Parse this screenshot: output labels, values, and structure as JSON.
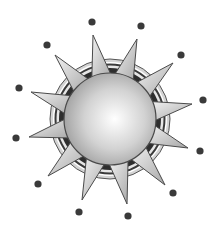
{
  "illustration": {
    "subject": "sun-clipart",
    "center": [
      110,
      119
    ],
    "sphere_radius": 46,
    "rings": [
      {
        "r": 60,
        "fill": "#d4d4d4",
        "stroke": "#555555"
      },
      {
        "r": 57,
        "fill": "#ffffff",
        "stroke": "none"
      },
      {
        "r": 55.5,
        "fill": "#3a3a3a",
        "stroke": "none"
      },
      {
        "r": 53.5,
        "fill": "#e6e6e6",
        "stroke": "none"
      },
      {
        "r": 51,
        "fill": "#2e2e2e",
        "stroke": "none"
      }
    ],
    "spikes": [
      {
        "tip": [
          93,
          35
        ],
        "base_angle_deg": -104
      },
      {
        "tip": [
          137,
          39
        ],
        "base_angle_deg": -72
      },
      {
        "tip": [
          173,
          63
        ],
        "base_angle_deg": -42
      },
      {
        "tip": [
          192,
          104
        ],
        "base_angle_deg": -11
      },
      {
        "tip": [
          188,
          148
        ],
        "base_angle_deg": 20
      },
      {
        "tip": [
          165,
          185
        ],
        "base_angle_deg": 50
      },
      {
        "tip": [
          127,
          204
        ],
        "base_angle_deg": 79
      },
      {
        "tip": [
          82,
          200
        ],
        "base_angle_deg": 109
      },
      {
        "tip": [
          48,
          176
        ],
        "base_angle_deg": 138
      },
      {
        "tip": [
          29,
          137
        ],
        "base_angle_deg": 168
      },
      {
        "tip": [
          31,
          92
        ],
        "base_angle_deg": 199
      },
      {
        "tip": [
          55,
          55
        ],
        "base_angle_deg": 229
      }
    ],
    "spike_half_width_deg": 13,
    "spike_base_radius": 44,
    "dots": [
      [
        92,
        22
      ],
      [
        141,
        26
      ],
      [
        181,
        55
      ],
      [
        203,
        100
      ],
      [
        200,
        151
      ],
      [
        173,
        193
      ],
      [
        128,
        216
      ],
      [
        79,
        212
      ],
      [
        38,
        184
      ],
      [
        16,
        138
      ],
      [
        19,
        88
      ],
      [
        47,
        45
      ]
    ],
    "dot_radius": 3.6,
    "colors": {
      "dot": "#3a3a3a",
      "outline": "#4a4a4a",
      "spike_light": "#f2f2f2",
      "spike_dark": "#a8a8a8",
      "sphere_highlight": "#ffffff",
      "sphere_mid": "#d2d2d2",
      "sphere_edge": "#9a9a9a"
    }
  }
}
